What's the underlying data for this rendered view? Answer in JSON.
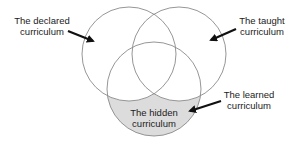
{
  "diagram": {
    "type": "venn",
    "circles": [
      {
        "id": "declared",
        "cx": 129,
        "cy": 54,
        "r": 47,
        "stroke": "#8a8a8a",
        "fill": "none"
      },
      {
        "id": "taught",
        "cx": 179,
        "cy": 54,
        "r": 47,
        "stroke": "#8a8a8a",
        "fill": "none"
      },
      {
        "id": "learned",
        "cx": 154,
        "cy": 89,
        "r": 47,
        "stroke": "#8a8a8a",
        "fill": "none"
      }
    ],
    "highlight_fill": "#dcdcdc",
    "labels": {
      "declared": {
        "line1": "The declared",
        "line2": "curriculum"
      },
      "taught": {
        "line1": "The taught",
        "line2": "curriculum"
      },
      "learned": {
        "line1": "The learned",
        "line2": "curriculum"
      },
      "hidden": {
        "line1": "The hidden",
        "line2": "curriculum"
      }
    }
  }
}
